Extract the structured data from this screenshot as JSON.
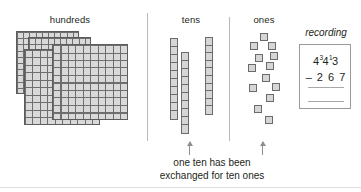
{
  "columns": {
    "hundreds_label": "hundreds",
    "tens_label": "tens",
    "ones_label": "ones"
  },
  "manipulatives": {
    "hundreds_flats_count": 4,
    "hundreds_flat_grid": "10x10",
    "tens_rods_count": 3,
    "tens_rod_segments": 10,
    "ones_cubes_count": 13,
    "ones_cubes": [
      {
        "x": 260,
        "y": 33
      },
      {
        "x": 250,
        "y": 42
      },
      {
        "x": 268,
        "y": 42
      },
      {
        "x": 255,
        "y": 54
      },
      {
        "x": 270,
        "y": 52
      },
      {
        "x": 248,
        "y": 64
      },
      {
        "x": 266,
        "y": 62
      },
      {
        "x": 262,
        "y": 74
      },
      {
        "x": 249,
        "y": 84
      },
      {
        "x": 272,
        "y": 83
      },
      {
        "x": 266,
        "y": 94
      },
      {
        "x": 254,
        "y": 105
      },
      {
        "x": 265,
        "y": 116
      }
    ]
  },
  "caption": {
    "line1": "one ten has been",
    "line2": "exchanged for ten ones"
  },
  "recording": {
    "title": "recording",
    "minuend": {
      "hundreds": "4",
      "tens_regroup_mark": "3",
      "tens": "4",
      "ones_regroup_mark": "1",
      "ones": "3"
    },
    "subtrahend": "– 2 6 7",
    "answer_line_1": "",
    "answer_line_2": ""
  },
  "annotations": {
    "arrow_tens": "up-arrow-tens",
    "arrow_ones": "up-arrow-ones"
  },
  "colors": {
    "block_fill": "#d6d6d6",
    "block_stroke": "#6b6b6b",
    "text": "#231f20",
    "divider": "#b9b9b9",
    "box_border": "#9a9a9a"
  }
}
